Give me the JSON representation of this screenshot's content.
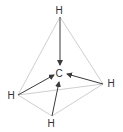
{
  "diagram": {
    "type": "molecular-geometry",
    "colors": {
      "edge": "#cfcfcf",
      "arrow": "#3a3a3a",
      "label": "#333333"
    },
    "center_atom": {
      "label": "C",
      "x": 59,
      "y": 77
    },
    "outer_atoms": [
      {
        "id": "top",
        "label": "H",
        "x": 59,
        "y": 14,
        "vx": 60,
        "vy": 17
      },
      {
        "id": "right",
        "label": "H",
        "x": 111,
        "y": 87,
        "vx": 103,
        "vy": 84
      },
      {
        "id": "left",
        "label": "H",
        "x": 11,
        "y": 99,
        "vx": 18,
        "vy": 95
      },
      {
        "id": "bottom",
        "label": "H",
        "x": 51,
        "y": 127,
        "vx": 52,
        "vy": 116
      }
    ],
    "edges": [
      [
        "top",
        "left"
      ],
      [
        "top",
        "right"
      ],
      [
        "left",
        "right"
      ],
      [
        "left",
        "bottom"
      ],
      [
        "right",
        "bottom"
      ]
    ],
    "arrows": [
      {
        "from": "top",
        "to": [
          60,
          65
        ]
      },
      {
        "from": "left",
        "to": [
          54,
          75
        ]
      },
      {
        "from": "right",
        "to": [
          67,
          74
        ]
      },
      {
        "from": "bottom",
        "to": [
          59,
          82
        ]
      }
    ]
  }
}
